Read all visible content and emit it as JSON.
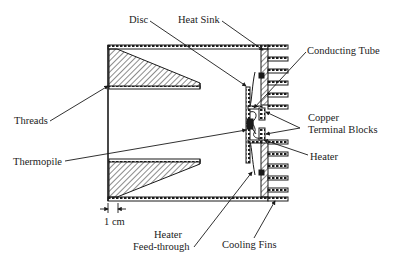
{
  "figure": {
    "type": "cross-section diagram"
  },
  "labels": {
    "disc": "Disc",
    "heat_sink": "Heat Sink",
    "conducting_tube": "Conducting Tube",
    "threads": "Threads",
    "copper_line1": "Copper",
    "copper_line2": "Terminal Blocks",
    "thermopile": "Thermopile",
    "heater": "Heater",
    "scale_bar": "1 cm",
    "feedthrough_line1": "Heater",
    "feedthrough_line2": "Feed-through",
    "cooling_fins": "Cooling Fins"
  },
  "colors": {
    "ink": "#1a1a1a",
    "background": "#ffffff"
  }
}
